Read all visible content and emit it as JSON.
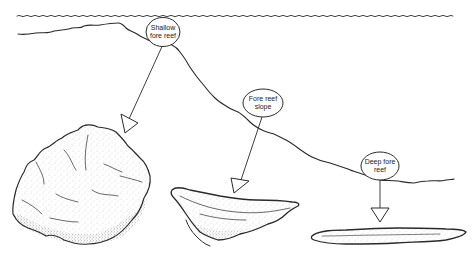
{
  "diagram": {
    "type": "reef-zonation-illustration",
    "water_surface": {
      "label": ""
    },
    "zones": [
      {
        "id": "shallow",
        "label_line1": "Shallow",
        "label_line2": "fore reef",
        "coral_form": "massive hemispherical mound"
      },
      {
        "id": "slope",
        "label_line1": "Fore  reef",
        "label_line2": "slope",
        "coral_form": "plate / bowl-shaped"
      },
      {
        "id": "deep",
        "label_line1": "Deep fore",
        "label_line2": "reef",
        "coral_form": "thin flattened plate"
      }
    ]
  },
  "colors": {
    "ink": "#2a2a2a",
    "background": "#ffffff",
    "stipple": "#555555"
  }
}
